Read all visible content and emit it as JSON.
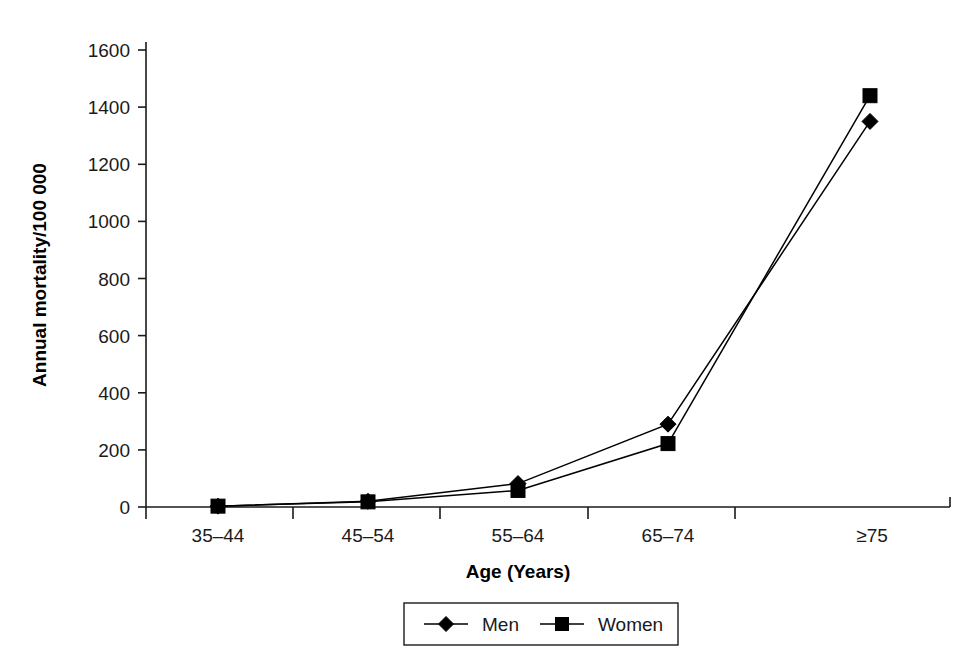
{
  "chart_data": {
    "type": "line",
    "title": "",
    "subtitle": "",
    "xlabel": "Age (Years)",
    "ylabel": "Annual mortality/100 000",
    "categories": [
      "35–44",
      "45–54",
      "55–64",
      "65–74",
      "≥75"
    ],
    "ytick_labels": [
      "0",
      "200",
      "400",
      "600",
      "800",
      "1000",
      "1200",
      "1400",
      "1600"
    ],
    "ytick_values": [
      0,
      200,
      400,
      600,
      800,
      1000,
      1200,
      1400,
      1600
    ],
    "ylim": [
      0,
      1600
    ],
    "grid": false,
    "legend_position": "bottom",
    "series": [
      {
        "name": "Men",
        "marker": "diamond",
        "color": "#000000",
        "values": [
          3,
          20,
          82,
          290,
          1350
        ]
      },
      {
        "name": "Women",
        "marker": "square",
        "color": "#000000",
        "values": [
          3,
          18,
          58,
          222,
          1440
        ]
      }
    ]
  },
  "legend": {
    "items": [
      {
        "label": "Men",
        "marker": "diamond"
      },
      {
        "label": "Women",
        "marker": "square"
      }
    ]
  },
  "axes": {
    "y_title": "Annual mortality/100 000",
    "x_title": "Age (Years)"
  }
}
